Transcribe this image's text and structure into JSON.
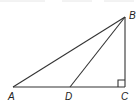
{
  "diagram": {
    "type": "right-triangle-with-cevian",
    "stroke_color": "#333333",
    "points": {
      "A": {
        "label": "A",
        "x": 13,
        "y": 87
      },
      "B": {
        "label": "B",
        "x": 125,
        "y": 17
      },
      "C": {
        "label": "C",
        "x": 125,
        "y": 87
      },
      "D": {
        "label": "D",
        "x": 70,
        "y": 87
      }
    },
    "segments": [
      "AB",
      "BC",
      "AC",
      "BD"
    ],
    "right_angle_at": "C",
    "labels": {
      "A": "A",
      "B": "B",
      "C": "C",
      "D": "D"
    }
  }
}
